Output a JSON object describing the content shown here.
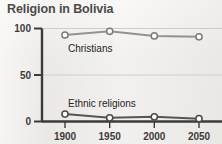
{
  "figure": {
    "title": "Religion in Bolivia",
    "background_color": "#eceae7",
    "axis_color": "#3d3b39",
    "grid_color": "#c9c7c4"
  },
  "chart_data": {
    "type": "line",
    "title": "Religion in Bolivia",
    "xlabel": "",
    "ylabel": "",
    "x": [
      1900,
      1950,
      2000,
      2050
    ],
    "categories": [
      "1900",
      "1950",
      "2000",
      "2050"
    ],
    "xtick_labels": [
      "1900",
      "1950",
      "2000",
      "2050"
    ],
    "ytick_labels": [
      "0",
      "50",
      "100"
    ],
    "yticks": [
      0,
      50,
      100
    ],
    "ylim": [
      0,
      100
    ],
    "xlim": [
      1900,
      2050
    ],
    "grid": true,
    "grid_axis": "y",
    "legend": "inline-labels",
    "series": [
      {
        "name": "Christians",
        "label": "Christians",
        "values": [
          93,
          97,
          92,
          91
        ],
        "line_color": "#949290",
        "marker": "circle",
        "marker_face": "#ffffff",
        "marker_edge": "#7d7b79"
      },
      {
        "name": "Ethnic religions",
        "label": "Ethnic religions",
        "values": [
          8,
          4,
          5,
          3
        ],
        "line_color": "#575553",
        "marker": "circle",
        "marker_face": "#ffffff",
        "marker_edge": "#4a4846"
      }
    ]
  }
}
